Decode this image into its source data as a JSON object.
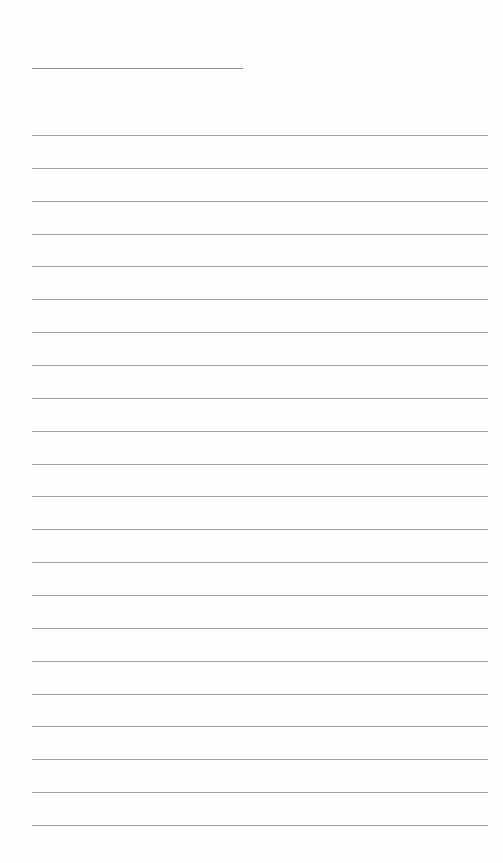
{
  "document": {
    "type": "lined-paper",
    "title_line": {
      "text": ""
    },
    "ruled_lines": [
      {
        "text": ""
      },
      {
        "text": ""
      },
      {
        "text": ""
      },
      {
        "text": ""
      },
      {
        "text": ""
      },
      {
        "text": ""
      },
      {
        "text": ""
      },
      {
        "text": ""
      },
      {
        "text": ""
      },
      {
        "text": ""
      },
      {
        "text": ""
      },
      {
        "text": ""
      },
      {
        "text": ""
      },
      {
        "text": ""
      },
      {
        "text": ""
      },
      {
        "text": ""
      },
      {
        "text": ""
      },
      {
        "text": ""
      },
      {
        "text": ""
      },
      {
        "text": ""
      },
      {
        "text": ""
      },
      {
        "text": ""
      }
    ],
    "colors": {
      "paper": "#fdfdfc",
      "line": "#a3a3a3",
      "title_line": "#8f8f8f"
    }
  }
}
